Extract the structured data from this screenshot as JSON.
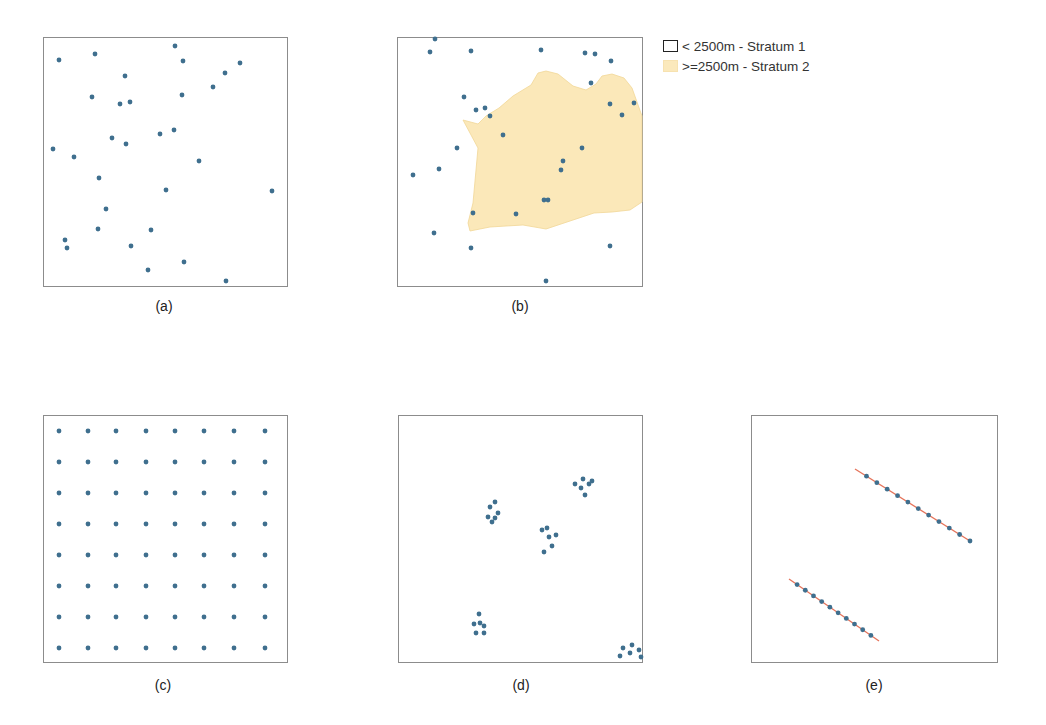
{
  "colors": {
    "point": "#3f6f8e",
    "stratum2_fill": "#fbe8b9",
    "stratum2_edge": "#f1d797",
    "transect_line": "#e5735a",
    "frame": "#8c8c8c"
  },
  "legend": {
    "items": [
      {
        "label": "< 2500m - Stratum 1",
        "swatch": "empty-box"
      },
      {
        "label": ">=2500m - Stratum 2",
        "swatch": "yellow-fill"
      }
    ]
  },
  "panels": [
    {
      "id": "a",
      "caption": "(a)",
      "type": "simple random sampling"
    },
    {
      "id": "b",
      "caption": "(b)",
      "type": "stratified random sampling"
    },
    {
      "id": "c",
      "caption": "(c)",
      "type": "systematic grid sampling"
    },
    {
      "id": "d",
      "caption": "(d)",
      "type": "cluster sampling"
    },
    {
      "id": "e",
      "caption": "(e)",
      "type": "line transect sampling"
    }
  ],
  "chart_data": [
    {
      "type": "scatter",
      "title": "(a)",
      "xlim": [
        0,
        244
      ],
      "ylim": [
        0,
        249
      ],
      "points": [
        [
          15,
          22
        ],
        [
          51,
          16
        ],
        [
          131,
          8
        ],
        [
          139,
          23
        ],
        [
          196,
          25
        ],
        [
          181,
          35
        ],
        [
          169,
          49
        ],
        [
          81,
          38
        ],
        [
          48,
          59
        ],
        [
          76,
          66
        ],
        [
          86,
          64
        ],
        [
          138,
          57
        ],
        [
          9,
          111
        ],
        [
          68,
          100
        ],
        [
          30,
          119
        ],
        [
          116,
          96
        ],
        [
          130,
          92
        ],
        [
          82,
          106
        ],
        [
          155,
          123
        ],
        [
          55,
          140
        ],
        [
          122,
          152
        ],
        [
          228,
          153
        ],
        [
          62,
          171
        ],
        [
          54,
          191
        ],
        [
          107,
          192
        ],
        [
          21,
          202
        ],
        [
          23,
          210
        ],
        [
          87,
          208
        ],
        [
          140,
          224
        ],
        [
          104,
          232
        ],
        [
          182,
          243
        ]
      ]
    },
    {
      "type": "scatter",
      "title": "(b)",
      "stratum2_polygon": [
        [
          65,
          82
        ],
        [
          80,
          86
        ],
        [
          88,
          78
        ],
        [
          101,
          70
        ],
        [
          115,
          58
        ],
        [
          133,
          47
        ],
        [
          140,
          35
        ],
        [
          148,
          33
        ],
        [
          160,
          36
        ],
        [
          175,
          48
        ],
        [
          188,
          52
        ],
        [
          198,
          46
        ],
        [
          204,
          38
        ],
        [
          214,
          36
        ],
        [
          226,
          40
        ],
        [
          234,
          50
        ],
        [
          244,
          78
        ],
        [
          244,
          164
        ],
        [
          232,
          172
        ],
        [
          214,
          174
        ],
        [
          196,
          175
        ],
        [
          175,
          182
        ],
        [
          148,
          191
        ],
        [
          125,
          187
        ],
        [
          92,
          189
        ],
        [
          72,
          193
        ],
        [
          70,
          185
        ],
        [
          75,
          165
        ],
        [
          80,
          110
        ]
      ],
      "points": [
        [
          37,
          1
        ],
        [
          32,
          14
        ],
        [
          73,
          13
        ],
        [
          143,
          12
        ],
        [
          187,
          15
        ],
        [
          197,
          16
        ],
        [
          213,
          23
        ],
        [
          193,
          45
        ],
        [
          236,
          65
        ],
        [
          212,
          66
        ],
        [
          224,
          77
        ],
        [
          66,
          59
        ],
        [
          78,
          72
        ],
        [
          87,
          70
        ],
        [
          92,
          78
        ],
        [
          105,
          97
        ],
        [
          59,
          110
        ],
        [
          184,
          110
        ],
        [
          41,
          131
        ],
        [
          15,
          137
        ],
        [
          165,
          123
        ],
        [
          163,
          132
        ],
        [
          146,
          162
        ],
        [
          150,
          162
        ],
        [
          75,
          175
        ],
        [
          118,
          176
        ],
        [
          36,
          195
        ],
        [
          73,
          210
        ],
        [
          212,
          208
        ],
        [
          148,
          243
        ]
      ]
    },
    {
      "type": "scatter",
      "title": "(c)",
      "grid": "8x8",
      "x": [
        15,
        44,
        72,
        102,
        131,
        160,
        190,
        221
      ],
      "y": [
        15,
        46,
        77,
        108,
        139,
        170,
        201,
        232
      ]
    },
    {
      "type": "scatter",
      "title": "(d)",
      "clusters": 5,
      "points": [
        [
          91,
          91
        ],
        [
          96,
          86
        ],
        [
          99,
          97
        ],
        [
          89,
          101
        ],
        [
          96,
          102
        ],
        [
          93,
          106
        ],
        [
          143,
          114
        ],
        [
          148,
          112
        ],
        [
          150,
          121
        ],
        [
          157,
          119
        ],
        [
          153,
          130
        ],
        [
          145,
          136
        ],
        [
          176,
          68
        ],
        [
          184,
          63
        ],
        [
          190,
          68
        ],
        [
          182,
          72
        ],
        [
          193,
          65
        ],
        [
          186,
          79
        ],
        [
          80,
          198
        ],
        [
          75,
          208
        ],
        [
          81,
          207
        ],
        [
          85,
          210
        ],
        [
          77,
          217
        ],
        [
          85,
          217
        ],
        [
          224,
          232
        ],
        [
          233,
          229
        ],
        [
          231,
          237
        ],
        [
          240,
          234
        ],
        [
          221,
          240
        ],
        [
          242,
          241
        ]
      ]
    },
    {
      "type": "line",
      "title": "(e)",
      "transects": [
        {
          "start": [
            103,
            53
          ],
          "end": [
            218,
            125
          ],
          "points": 11
        },
        {
          "start": [
            37,
            163
          ],
          "end": [
            127,
            225
          ],
          "points": 10
        }
      ]
    }
  ]
}
